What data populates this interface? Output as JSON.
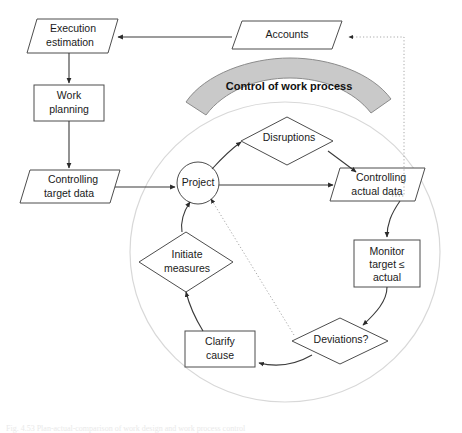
{
  "figure": {
    "type": "flowchart-diagram",
    "caption": "Fig. 4.53  Plan-actual-comparison of work design and work process control",
    "background": "#ffffff"
  },
  "banner": {
    "label": "Control of work process",
    "fill": "#c9c9c9",
    "stroke": "#8c8c8c"
  },
  "cycle_boundary": {
    "name": "control-cycle-circle",
    "stroke": "#d8d8d8"
  },
  "nodes": [
    {
      "id": "execution-estimation",
      "label": "Execution\nestimation",
      "line1": "Execution",
      "line2": "estimation",
      "shape": "parallelogram",
      "x": 27,
      "y": 19,
      "w": 91,
      "h": 34
    },
    {
      "id": "accounts",
      "label": "Accounts",
      "line1": "Accounts",
      "line2": "",
      "shape": "parallelogram",
      "x": 232,
      "y": 21,
      "w": 110,
      "h": 28
    },
    {
      "id": "work-planning",
      "label": "Work\nplanning",
      "line1": "Work",
      "line2": "planning",
      "shape": "rectangle",
      "x": 34,
      "y": 85,
      "w": 70,
      "h": 34
    },
    {
      "id": "controlling-target-data",
      "label": "Controlling\ntarget data",
      "line1": "Controlling",
      "line2": "target data",
      "shape": "parallelogram",
      "x": 20,
      "y": 170,
      "w": 100,
      "h": 33
    },
    {
      "id": "project",
      "label": "Project",
      "line1": "Project",
      "line2": "",
      "shape": "circle",
      "cx": 198,
      "cy": 183,
      "r": 21
    },
    {
      "id": "disruptions",
      "label": "Disruptions",
      "line1": "Disruptions",
      "line2": "",
      "shape": "diamond",
      "cx": 287,
      "cy": 141,
      "rx": 46,
      "ry": 24
    },
    {
      "id": "controlling-actual-data",
      "label": "Controlling\nactual data",
      "line1": "Controlling",
      "line2": "actual data",
      "shape": "parallelogram",
      "x": 330,
      "y": 168,
      "w": 95,
      "h": 33
    },
    {
      "id": "monitor-target-actual",
      "label": "Monitor\ntarget ≤\nactual",
      "line1": "Monitor",
      "line2": "target ≤",
      "line3": "actual",
      "shape": "rectangle",
      "x": 354,
      "y": 240,
      "w": 66,
      "h": 46
    },
    {
      "id": "deviations",
      "label": "Deviations?",
      "line1": "Deviations?",
      "line2": "",
      "shape": "diamond",
      "cx": 340,
      "cy": 341,
      "rx": 48,
      "ry": 23
    },
    {
      "id": "clarify-cause",
      "label": "Clarify\ncause",
      "line1": "Clarify",
      "line2": "cause",
      "shape": "rectangle",
      "x": 185,
      "y": 331,
      "w": 70,
      "h": 36
    },
    {
      "id": "initiate-measures",
      "label": "Initiate\nmeasures",
      "line1": "Initiate",
      "line2": "measures",
      "shape": "diamond",
      "cx": 186,
      "cy": 262,
      "rx": 47,
      "ry": 30
    }
  ],
  "connections": [
    {
      "id": "accounts-to-execution",
      "from": "accounts",
      "to": "execution-estimation",
      "style": "solid"
    },
    {
      "id": "execution-to-work-planning",
      "from": "execution-estimation",
      "to": "work-planning",
      "style": "solid"
    },
    {
      "id": "work-planning-to-target-data",
      "from": "work-planning",
      "to": "controlling-target-data",
      "style": "solid"
    },
    {
      "id": "target-data-to-project",
      "from": "controlling-target-data",
      "to": "project",
      "style": "solid"
    },
    {
      "id": "project-to-disruptions",
      "from": "project",
      "to": "disruptions",
      "style": "solid"
    },
    {
      "id": "disruptions-to-actual-data",
      "from": "disruptions",
      "to": "controlling-actual-data",
      "style": "solid"
    },
    {
      "id": "project-to-actual-data",
      "from": "project",
      "to": "controlling-actual-data",
      "style": "solid"
    },
    {
      "id": "actual-data-to-monitor",
      "from": "controlling-actual-data",
      "to": "monitor-target-actual",
      "style": "solid"
    },
    {
      "id": "monitor-to-deviations",
      "from": "monitor-target-actual",
      "to": "deviations",
      "style": "solid"
    },
    {
      "id": "deviations-to-clarify-cause",
      "from": "deviations",
      "to": "clarify-cause",
      "style": "solid"
    },
    {
      "id": "clarify-cause-to-initiate-measures",
      "from": "clarify-cause",
      "to": "initiate-measures",
      "style": "solid"
    },
    {
      "id": "initiate-measures-to-project",
      "from": "initiate-measures",
      "to": "project",
      "style": "solid"
    },
    {
      "id": "actual-data-to-accounts-dotted",
      "from": "controlling-actual-data",
      "to": "accounts",
      "style": "dotted"
    },
    {
      "id": "deviations-to-project-dotted",
      "from": "deviations",
      "to": "project",
      "style": "dotted"
    }
  ]
}
